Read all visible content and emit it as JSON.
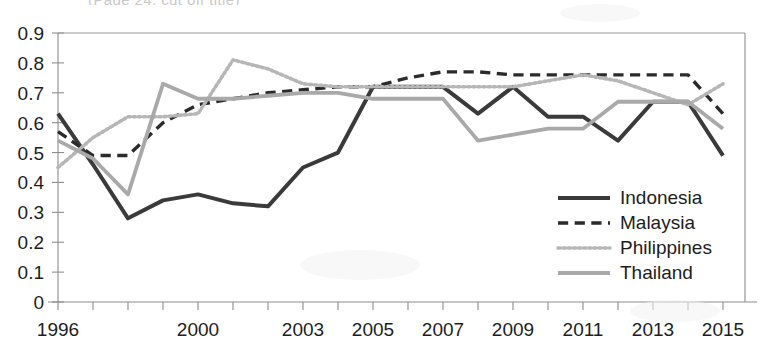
{
  "figure": {
    "clipped_title_text": "(Page 24, cut off title)",
    "background_color": "#ffffff"
  },
  "chart_data": {
    "type": "line",
    "title": "",
    "subtitle": "",
    "xlabel": "",
    "ylabel": "",
    "grid": false,
    "legend_position": "inside-bottom-right",
    "xlim": [
      1996,
      2015
    ],
    "ylim": [
      0,
      0.9
    ],
    "y_ticks": [
      0,
      0.1,
      0.2,
      0.3,
      0.4,
      0.5,
      0.6,
      0.7,
      0.8,
      0.9
    ],
    "y_tick_labels": [
      "0",
      "0.1",
      "0.2",
      "0.3",
      "0.4",
      "0.5",
      "0.6",
      "0.7",
      "0.8",
      "0.9"
    ],
    "x": [
      1996,
      1997,
      1998,
      1999,
      2000,
      2001,
      2002,
      2003,
      2004,
      2005,
      2006,
      2007,
      2008,
      2009,
      2010,
      2011,
      2012,
      2013,
      2014,
      2015
    ],
    "x_tick_labels": [
      "1996",
      "",
      "",
      "",
      "2000",
      "",
      "",
      "2003",
      "",
      "2005",
      "",
      "2007",
      "",
      "2009",
      "",
      "2011",
      "",
      "2013",
      "",
      "2015"
    ],
    "x_labeled_ticks": [
      1996,
      2000,
      2003,
      2005,
      2007,
      2009,
      2011,
      2013,
      2015
    ],
    "series": [
      {
        "name": "Indonesia",
        "color": "#3a3a3a",
        "style": "solid",
        "width": 4.0,
        "values": [
          0.63,
          0.46,
          0.28,
          0.34,
          0.36,
          0.33,
          0.32,
          0.45,
          0.5,
          0.72,
          0.72,
          0.72,
          0.63,
          0.72,
          0.62,
          0.62,
          0.54,
          0.67,
          0.67,
          0.49
        ]
      },
      {
        "name": "Malaysia",
        "color": "#2b2b2b",
        "style": "dashed",
        "width": 3.4,
        "values": [
          0.57,
          0.49,
          0.49,
          0.6,
          0.66,
          0.68,
          0.7,
          0.71,
          0.72,
          0.72,
          0.75,
          0.77,
          0.77,
          0.76,
          0.76,
          0.76,
          0.76,
          0.76,
          0.76,
          0.63
        ]
      },
      {
        "name": "Philippines",
        "color": "#b6b6b6",
        "style": "dotted",
        "width": 3.6,
        "values": [
          0.45,
          0.55,
          0.62,
          0.62,
          0.63,
          0.81,
          0.78,
          0.73,
          0.72,
          0.72,
          0.72,
          0.72,
          0.72,
          0.72,
          0.74,
          0.76,
          0.74,
          0.7,
          0.66,
          0.73
        ]
      },
      {
        "name": "Thailand",
        "color": "#a9a9a9",
        "style": "solid",
        "width": 3.8,
        "values": [
          0.54,
          0.48,
          0.36,
          0.73,
          0.68,
          0.68,
          0.69,
          0.7,
          0.7,
          0.68,
          0.68,
          0.68,
          0.54,
          0.56,
          0.58,
          0.58,
          0.67,
          0.67,
          0.67,
          0.58
        ]
      }
    ]
  },
  "legend": {
    "items": [
      {
        "label": "Indonesia"
      },
      {
        "label": "Malaysia"
      },
      {
        "label": "Philippines"
      },
      {
        "label": "Thailand"
      }
    ]
  }
}
